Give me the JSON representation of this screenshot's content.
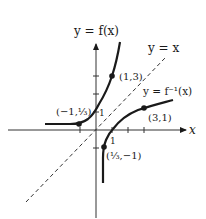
{
  "diagram": {
    "type": "function-and-inverse-graph",
    "labels": {
      "f_curve": "y = f(x)",
      "identity_line": "y = x",
      "inverse_curve": "y = f⁻¹(x)",
      "x_axis": "x",
      "tick_x_1": "1",
      "tick_y_1": "1"
    },
    "points": [
      {
        "id": "f-point-1",
        "label": "(1,3)",
        "x": 1,
        "y": 3
      },
      {
        "id": "f-point-2",
        "label": "(−1,⅓)",
        "x": -1,
        "y": 0.333
      },
      {
        "id": "finv-point-1",
        "label": "(3,1)",
        "x": 3,
        "y": 1
      },
      {
        "id": "finv-point-2",
        "label": "(⅓,−1)",
        "x": 0.333,
        "y": -1
      }
    ],
    "colors": {
      "curve": "#1a1a1a",
      "axis": "#333333",
      "dashed": "#333333"
    }
  }
}
